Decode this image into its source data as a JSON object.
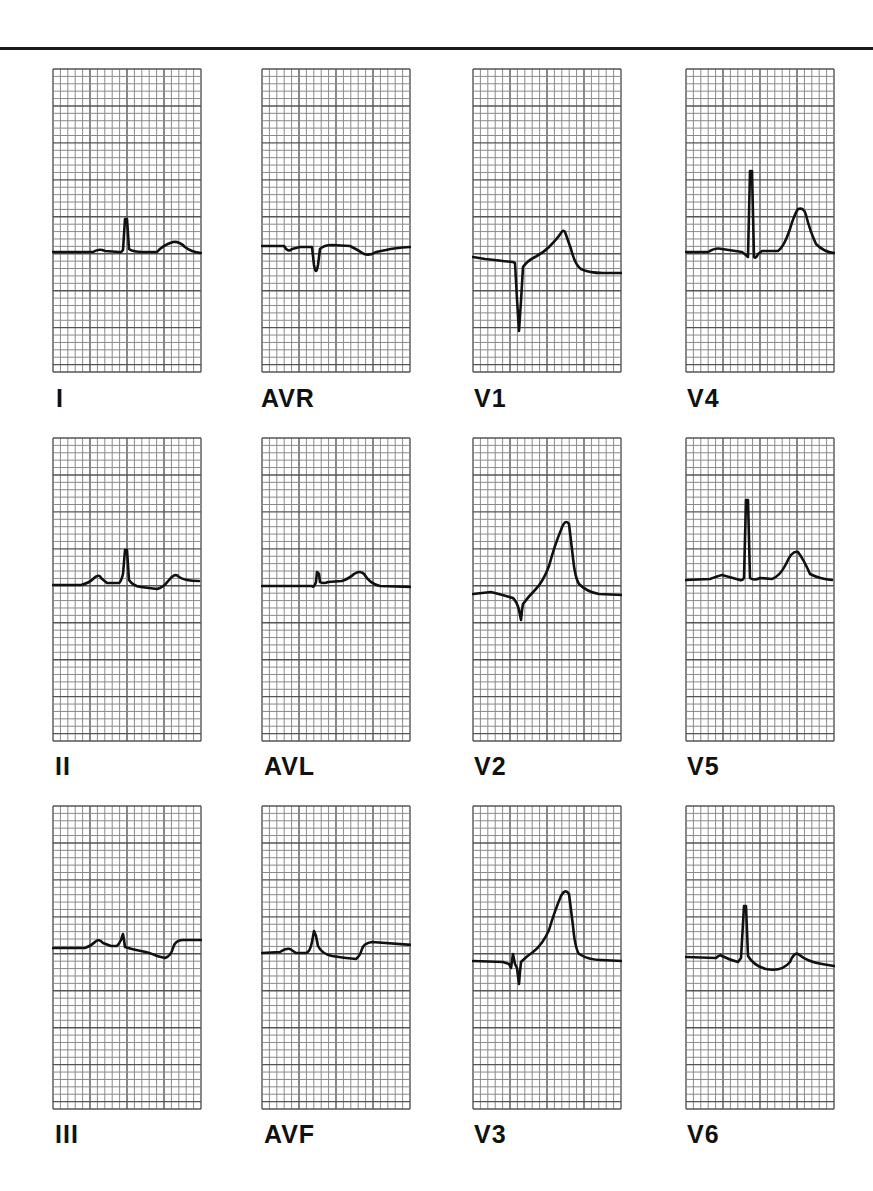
{
  "figure": {
    "grid": {
      "columns": 20,
      "rows": 41,
      "major_every": 5,
      "minor_color": "#8a8a8a",
      "major_color": "#555555",
      "paper_color": "#ffffff"
    },
    "trace_color": "#111111"
  },
  "leads": [
    {
      "id": "I",
      "label": "I",
      "x": 52,
      "y": 68,
      "label_x": 56,
      "label_y": 386,
      "path": "M0,183 L40,183 Q46,179 52,182 L66,183 Q68,184 70,181 L72,150 L74,150 L76,180 Q80,183 90,183 L104,183 Q110,176 120,173 Q126,172 132,178 Q138,183 148,184"
    },
    {
      "id": "AVR",
      "label": "AVR",
      "x": 261,
      "y": 68,
      "label_x": 261,
      "label_y": 386,
      "path": "M0,177 L22,177 Q26,184 30,180 L38,178 L48,178 L50,178 L52,196 Q54,208 56,196 L58,180 Q62,176 70,176 L88,177 Q96,181 102,185 Q108,187 114,183 L124,181 Q132,179 148,178"
    },
    {
      "id": "V1",
      "label": "V1",
      "x": 472,
      "y": 68,
      "label_x": 474,
      "label_y": 386,
      "path": "M0,188 L12,190 Q30,192 40,193 L42,194 L44,230 L46,262 L48,232 L50,198 Q54,192 62,188 Q70,184 76,178 Q84,170 88,164 Q90,160 92,163 L98,180 Q102,196 108,200 Q116,204 130,204 L150,204"
    },
    {
      "id": "V4",
      "label": "V4",
      "x": 685,
      "y": 68,
      "label_x": 687,
      "label_y": 386,
      "path": "M0,183 L22,183 Q30,178 36,180 L56,183 Q60,186 62,188 L64,102 L66,102 L68,188 Q70,190 72,185 L76,182 L92,182 Q98,178 104,160 Q108,146 112,140 Q118,138 120,146 Q124,162 130,175 Q138,183 148,184"
    },
    {
      "id": "II",
      "label": "II",
      "x": 52,
      "y": 437,
      "label_x": 55,
      "label_y": 754,
      "path": "M0,147 L28,147 Q36,145 40,141 Q46,135 48,140 L54,145 L66,145 Q68,144 70,136 L72,112 L74,112 L76,142 Q80,148 88,149 L104,151 Q110,150 116,142 Q122,134 126,139 Q132,143 146,143"
    },
    {
      "id": "AVL",
      "label": "AVL",
      "x": 261,
      "y": 437,
      "label_x": 264,
      "label_y": 754,
      "path": "M0,148 L50,148 Q52,150 54,144 L55,134 L57,136 L58,144 Q62,146 66,144 L80,143 Q88,140 92,136 Q98,132 102,136 Q108,146 118,148 L150,149"
    },
    {
      "id": "V2",
      "label": "V2",
      "x": 472,
      "y": 437,
      "label_x": 474,
      "label_y": 754,
      "path": "M0,156 L18,154 Q30,157 40,160 Q44,164 46,172 L48,182 L49,172 L50,166 Q56,158 62,152 Q70,144 76,128 Q82,106 88,92 Q92,80 96,86 L100,120 Q102,140 106,146 Q114,154 126,156 L150,157"
    },
    {
      "id": "V5",
      "label": "V5",
      "x": 685,
      "y": 437,
      "label_x": 687,
      "label_y": 754,
      "path": "M0,142 L24,141 Q32,138 36,137 L54,142 Q56,143 58,140 L60,62 L62,62 L64,140 Q68,143 74,140 L86,141 Q94,138 100,126 Q106,112 112,114 Q118,122 124,136 Q134,141 146,142"
    },
    {
      "id": "III",
      "label": "III",
      "x": 52,
      "y": 805,
      "label_x": 55,
      "label_y": 1122,
      "path": "M0,142 L32,142 Q38,140 42,136 Q46,132 50,137 L58,140 L64,140 Q66,138 68,134 L70,128 L71,134 L72,141 Q78,143 88,145 Q98,147 104,150 L112,152 Q118,150 120,142 Q122,134 130,134 L148,134"
    },
    {
      "id": "AVF",
      "label": "AVF",
      "x": 261,
      "y": 805,
      "label_x": 264,
      "label_y": 1122,
      "path": "M0,147 L18,146 Q24,142 28,143 L34,147 L44,147 Q48,146 50,136 L52,125 L54,130 L56,140 Q60,148 70,150 Q82,152 94,153 Q98,150 100,143 Q102,137 110,136 L150,139"
    },
    {
      "id": "V3",
      "label": "V3",
      "x": 472,
      "y": 805,
      "label_x": 474,
      "label_y": 1122,
      "path": "M0,155 L30,156 L36,158 L38,162 L40,148 L42,158 L44,162 L46,178 L47,166 L48,156 Q54,150 60,146 Q70,138 76,124 Q82,104 88,90 Q92,82 96,88 L100,120 Q102,142 106,148 Q116,154 128,154 L150,155"
    },
    {
      "id": "V6",
      "label": "V6",
      "x": 685,
      "y": 805,
      "label_x": 687,
      "label_y": 1122,
      "path": "M0,151 L30,152 Q34,148 36,150 Q44,154 52,156 L55,152 L58,100 L60,100 L62,150 Q68,160 80,163 Q96,166 104,156 Q108,146 112,148 Q122,156 136,158 L148,160"
    }
  ]
}
